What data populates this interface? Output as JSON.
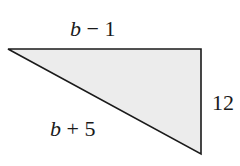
{
  "diagram": {
    "type": "right-triangle",
    "fill_color": "#ececec",
    "stroke_color": "#1a1a1a",
    "labels": {
      "top_side": {
        "variable": "b",
        "operator": "−",
        "constant": "1"
      },
      "hypotenuse": {
        "variable": "b",
        "operator": "+",
        "constant": "5"
      },
      "right_side": {
        "text": "12"
      }
    }
  }
}
